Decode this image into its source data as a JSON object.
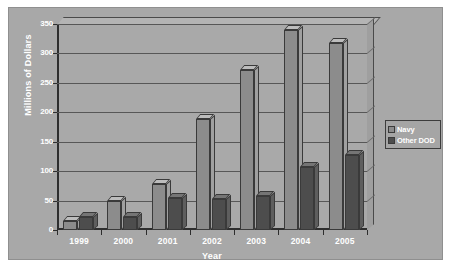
{
  "chart_data": {
    "type": "bar",
    "title": "",
    "xlabel": "Year",
    "ylabel": "Millions of Dollars",
    "categories": [
      "1999",
      "2000",
      "2001",
      "2002",
      "2003",
      "2004",
      "2005"
    ],
    "series": [
      {
        "name": "Navy",
        "color": "#8c8c8c",
        "values": [
          15,
          50,
          78,
          188,
          272,
          340,
          318
        ]
      },
      {
        "name": "Other DOD",
        "color": "#4d4d4d",
        "values": [
          22,
          22,
          55,
          53,
          58,
          107,
          128
        ]
      }
    ],
    "ylim": [
      0,
      350
    ],
    "yticks": [
      0,
      50,
      100,
      150,
      200,
      250,
      300,
      350
    ],
    "ytick_labels": [
      "0",
      "50",
      "100",
      "150",
      "200",
      "250",
      "300",
      "350"
    ],
    "grid": true,
    "legend_position": "right",
    "style": "3d-clustered-column"
  },
  "legend": {
    "items": [
      {
        "label": "Navy"
      },
      {
        "label": "Other DOD"
      }
    ]
  },
  "colors": {
    "plot_background": "#a9a9a9",
    "frame_background": "#a8a8a8",
    "axis": "#2e2e2e",
    "gridline": "#575757",
    "text": "#ffffff",
    "navy_series": "#8c8c8c",
    "other_dod_series": "#4d4d4d"
  }
}
